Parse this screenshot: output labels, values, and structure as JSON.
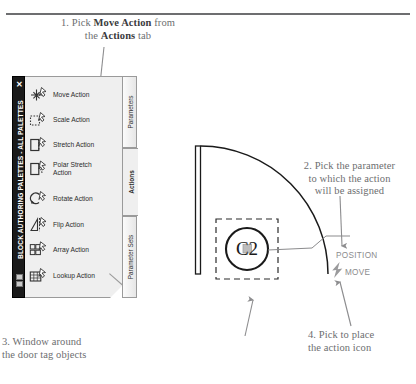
{
  "document": {
    "type": "instructional-diagram",
    "subject": "AutoCAD Block Authoring Palettes - assigning a Move Action"
  },
  "callouts": [
    {
      "id": "callout-1",
      "number": "1.",
      "text_parts": [
        "1. Pick ",
        "Move Action",
        " from the ",
        "Actions",
        " tab"
      ],
      "plain": "1. Pick Move Action from the Actions tab",
      "line1_pre": "1. Pick ",
      "line1_bold": "Move Action",
      "line1_post": " from",
      "line2_pre": "the ",
      "line2_bold": "Actions",
      "line2_post": " tab"
    },
    {
      "id": "callout-2",
      "plain": "2. Pick the parameter to which the action will be assigned",
      "line1": "2. Pick the parameter",
      "line2": "to which the action",
      "line3": "will be assigned"
    },
    {
      "id": "callout-3",
      "plain": "3. Window around the door tag objects",
      "line1": "3. Window around",
      "line2": "the door tag objects"
    },
    {
      "id": "callout-4",
      "plain": "4. Pick to place the action icon",
      "line1": "4. Pick to place",
      "line2": "the action icon"
    }
  ],
  "palette": {
    "title": "BLOCK AUTHORING PALETTES - ALL PALETTES",
    "close_label": "✕",
    "items": [
      {
        "label": "Move Action",
        "icon": "move-action-icon"
      },
      {
        "label": "Scale Action",
        "icon": "scale-action-icon"
      },
      {
        "label": "Stretch Action",
        "icon": "stretch-action-icon"
      },
      {
        "label": "Polar Stretch\nAction",
        "icon": "polar-stretch-action-icon",
        "line1": "Polar Stretch",
        "line2": "Action"
      },
      {
        "label": "Rotate Action",
        "icon": "rotate-action-icon"
      },
      {
        "label": "Flip Action",
        "icon": "flip-action-icon"
      },
      {
        "label": "Array Action",
        "icon": "array-action-icon"
      },
      {
        "label": "Lookup Action",
        "icon": "lookup-action-icon"
      }
    ],
    "tabs": [
      {
        "label": "Parameters",
        "active": false
      },
      {
        "label": "Actions",
        "active": true
      },
      {
        "label": "Parameter Sets",
        "active": false
      }
    ]
  },
  "drawing": {
    "door_tag_text": "C2",
    "position_label": "POSITION",
    "move_label": "MOVE",
    "move_icon": "lightning-bolt-icon",
    "selection_window": "dashed-selection-window"
  },
  "colors": {
    "text_gray": "#6d6e70",
    "text_dark": "#3b3b3d",
    "titlebar_bg": "#1a1a1a",
    "palette_bg": "#efefef",
    "line": "#9a9a9a",
    "cad_line": "#1a1a1a",
    "label_gray": "#8b8b8d"
  }
}
